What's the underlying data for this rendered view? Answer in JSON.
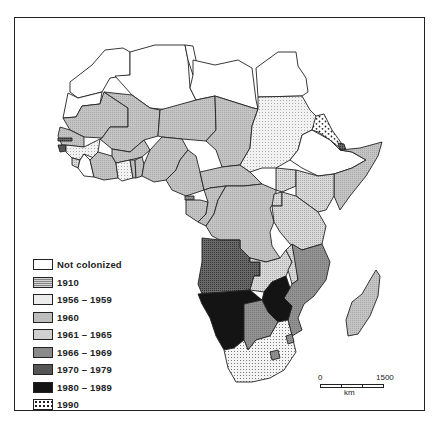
{
  "map": {
    "title": "",
    "subject": "Decolonization of Africa by year of independence",
    "colors": {
      "not_colonized": "#ffffff",
      "y1910": "#e6e6e6",
      "y1956_1959": "#eeeeee",
      "y1960": "#bdbdbd",
      "y1961_1965": "#d2d2d2",
      "y1966_1969": "#8a8a8a",
      "y1970_1979": "#5a5a5a",
      "y1980_1989": "#141414",
      "y1990": "#ffffff",
      "border": "#222222",
      "ocean": "#ffffff"
    }
  },
  "legend": {
    "items": [
      {
        "label": "Not colonized",
        "pattern": "not_colonized"
      },
      {
        "label": "1910",
        "pattern": "y1910"
      },
      {
        "label": "1956 – 1959",
        "pattern": "y1956_1959"
      },
      {
        "label": "1960",
        "pattern": "y1960"
      },
      {
        "label": "1961 – 1965",
        "pattern": "y1961_1965"
      },
      {
        "label": "1966 – 1969",
        "pattern": "y1966_1969"
      },
      {
        "label": "1970 – 1979",
        "pattern": "y1970_1979"
      },
      {
        "label": "1980 – 1989",
        "pattern": "y1980_1989"
      },
      {
        "label": "1990",
        "pattern": "y1990"
      }
    ]
  },
  "scale_bar": {
    "start": "0",
    "end": "1500",
    "unit": "km"
  }
}
